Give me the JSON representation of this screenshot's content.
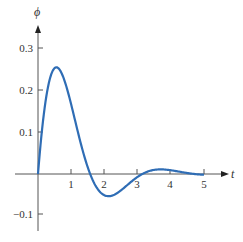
{
  "chart_data": {
    "type": "line",
    "title": "",
    "xlabel": "t",
    "ylabel": "ϕ",
    "xlim": [
      -0.7,
      5.6
    ],
    "ylim": [
      -0.14,
      0.36
    ],
    "x_ticks": [
      "1",
      "2",
      "3",
      "4",
      "5"
    ],
    "y_ticks": [
      "0.3",
      "0.2",
      "0.1",
      "−0.1"
    ],
    "grid": false,
    "legend": null,
    "series": [
      {
        "name": "ϕ(t)",
        "color": "#2f6db5",
        "x": [
          0,
          0.25,
          0.5,
          0.58,
          0.75,
          1.0,
          1.25,
          1.5,
          1.57,
          1.75,
          2.0,
          2.15,
          2.5,
          2.75,
          3.0,
          3.14,
          3.25,
          3.5,
          3.7,
          4.0,
          4.25,
          4.5,
          4.71,
          5.0
        ],
        "values": [
          0,
          0.187,
          0.255,
          0.26,
          0.236,
          0.152,
          0.055,
          0.016,
          0,
          -0.031,
          -0.051,
          -0.053,
          -0.039,
          -0.022,
          -0.007,
          0,
          0.004,
          0.01,
          0.012,
          0.009,
          0.006,
          0.002,
          0,
          -0.002
        ]
      }
    ]
  },
  "labels": {
    "y_axis": "ϕ",
    "x_axis": "t",
    "yt_03": "0.3",
    "yt_02": "0.2",
    "yt_01": "0.1",
    "yt_m01": "−0.1",
    "xt_1": "1",
    "xt_2": "2",
    "xt_3": "3",
    "xt_4": "4",
    "xt_5": "5"
  }
}
